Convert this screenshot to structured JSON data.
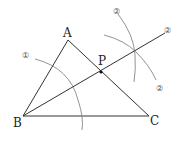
{
  "diagram": {
    "type": "geometric-construction",
    "points": {
      "A": {
        "label": "A",
        "x": 68,
        "y": 40
      },
      "B": {
        "label": "B",
        "x": 23,
        "y": 116
      },
      "C": {
        "label": "C",
        "x": 149,
        "y": 116
      },
      "P": {
        "label": "P",
        "x": 101,
        "y": 72
      }
    },
    "step_labels": {
      "step1": "①",
      "step2a": "②",
      "step2b": "②",
      "step2c": "②"
    },
    "colors": {
      "line": "#333333",
      "arc": "#777777",
      "point": "#111111",
      "text": "#222222"
    }
  }
}
